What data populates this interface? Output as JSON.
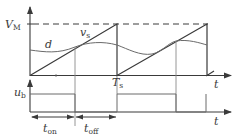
{
  "diagram": {
    "upper_plot": {
      "y_label_main": "V",
      "y_label_sub": "M",
      "x_label": "t",
      "carrier_label_main": "v",
      "carrier_label_sub": "s",
      "modulating_label": "d",
      "period_label_main": "T",
      "period_label_sub": "s"
    },
    "lower_plot": {
      "y_label_main": "u",
      "y_label_sub": "b",
      "x_label": "t",
      "on_label_main": "t",
      "on_label_sub": "on",
      "off_label_main": "t",
      "off_label_sub": "off"
    },
    "colors": {
      "line": "#3a3a3a",
      "curve": "#6a6a6a",
      "guide": "#8a8a8a",
      "background": "#ffffff"
    }
  }
}
